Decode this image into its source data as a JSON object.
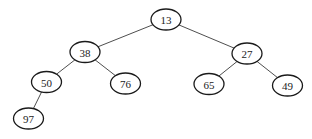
{
  "diagram": {
    "type": "binary-tree",
    "colors": {
      "background": "#ffffff",
      "node_stroke": "#1a1a1a",
      "node_fill": "#ffffff",
      "edge_stroke": "#3a3a3a",
      "text": "#222222"
    },
    "node_size": {
      "rx": 15,
      "ry": 10.5
    },
    "nodes": [
      {
        "id": "n13",
        "label": "13",
        "cx": 166,
        "cy": 19.5
      },
      {
        "id": "n38",
        "label": "38",
        "cx": 85,
        "cy": 52
      },
      {
        "id": "n27",
        "label": "27",
        "cx": 247,
        "cy": 53.5
      },
      {
        "id": "n50",
        "label": "50",
        "cx": 46.5,
        "cy": 82
      },
      {
        "id": "n76",
        "label": "76",
        "cx": 125.5,
        "cy": 83.5
      },
      {
        "id": "n65",
        "label": "65",
        "cx": 209,
        "cy": 84
      },
      {
        "id": "n49",
        "label": "49",
        "cx": 287.5,
        "cy": 85.5
      },
      {
        "id": "n97",
        "label": "97",
        "cx": 28.5,
        "cy": 118.5
      }
    ],
    "edges": [
      {
        "from": "n13",
        "to": "n38"
      },
      {
        "from": "n13",
        "to": "n27"
      },
      {
        "from": "n38",
        "to": "n50"
      },
      {
        "from": "n38",
        "to": "n76"
      },
      {
        "from": "n27",
        "to": "n65"
      },
      {
        "from": "n27",
        "to": "n49"
      },
      {
        "from": "n50",
        "to": "n97"
      }
    ]
  }
}
